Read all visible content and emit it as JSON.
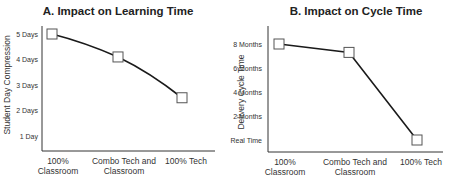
{
  "chart_data": [
    {
      "type": "line",
      "title": "A. Impact on Learning Time",
      "xlabel": "",
      "ylabel": "Student Day Compression",
      "categories": [
        "100% Classroom",
        "Combo Tech and Classroom",
        "100% Tech"
      ],
      "category_lines": [
        [
          "100%",
          "Classroom"
        ],
        [
          "Combo Tech and",
          "Classroom"
        ],
        [
          "100% Tech"
        ]
      ],
      "yticks": [
        "1 Day",
        "2 Days",
        "3 Days",
        "4 Days",
        "5 Days"
      ],
      "ytick_values": [
        1,
        2,
        3,
        4,
        5
      ],
      "values": [
        5,
        4.1,
        2.5
      ],
      "ylim": [
        0.5,
        5.6
      ],
      "grid": false,
      "legend": null
    },
    {
      "type": "line",
      "title": "B. Impact on Cycle Time",
      "xlabel": "",
      "ylabel": "Delivery Cycle Time",
      "categories": [
        "100% Classroom",
        "Combo Tech and Classroom",
        "100% Tech"
      ],
      "category_lines": [
        [
          "100%",
          "Classroom"
        ],
        [
          "Combo Tech and",
          "Classroom"
        ],
        [
          "100% Tech"
        ]
      ],
      "yticks": [
        "Real Time",
        "2 Months",
        "4 Months",
        "6 Months",
        "8 Months"
      ],
      "ytick_values": [
        0,
        2,
        4,
        6,
        8
      ],
      "values": [
        8,
        7.3,
        0
      ],
      "ylim": [
        -1,
        9.5
      ],
      "grid": false,
      "legend": null
    }
  ],
  "colors": {
    "line": "#1a1a1a",
    "marker_fill": "#ffffff",
    "marker_stroke": "#555555",
    "axis": "#333333"
  }
}
